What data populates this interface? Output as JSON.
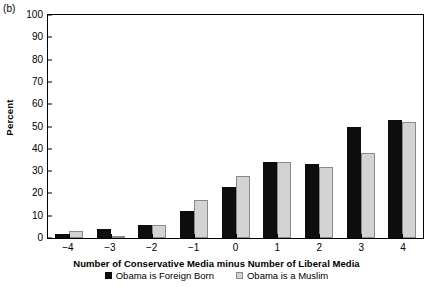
{
  "panel_label": "(b)",
  "chart_data": {
    "type": "bar",
    "title": "",
    "subtitle": "",
    "xlabel": "Number of Conservative Media minus Number of Liberal Media",
    "ylabel": "Percent",
    "categories": [
      "−4",
      "−3",
      "−2",
      "−1",
      "0",
      "1",
      "2",
      "3",
      "4"
    ],
    "series": [
      {
        "name": "Obama is Foreign Born",
        "color": "#0d0d0d",
        "values": [
          2,
          4,
          6,
          12,
          23,
          34,
          33,
          50,
          53
        ]
      },
      {
        "name": "Obama is a Muslim",
        "color": "#d3d3d3",
        "values": [
          3,
          1,
          6,
          17,
          28,
          34,
          32,
          38,
          52
        ]
      }
    ],
    "ylim": [
      0,
      100
    ],
    "yticks": [
      0,
      10,
      20,
      30,
      40,
      50,
      60,
      70,
      80,
      90,
      100
    ],
    "ytick_labels": [
      "0",
      "10",
      "20",
      "30",
      "40",
      "50",
      "60",
      "70",
      "80",
      "90",
      "100"
    ],
    "grid": false,
    "legend_position": "below"
  }
}
